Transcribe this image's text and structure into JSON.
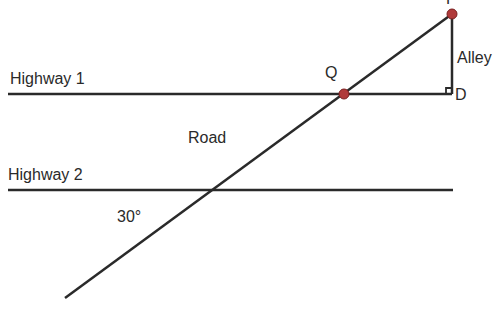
{
  "labels": {
    "highway1": "Highway 1",
    "highway2": "Highway 2",
    "road": "Road",
    "alley": "Alley",
    "angle": "30°",
    "point_p": "P",
    "point_q": "Q",
    "point_d": "D"
  },
  "colors": {
    "line": "#2a2a2a",
    "point": "#b03a3a",
    "background": "#ffffff"
  }
}
